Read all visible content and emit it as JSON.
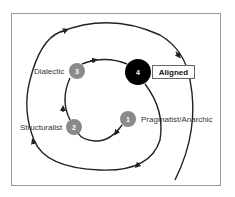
{
  "diagram": {
    "type": "spiral-cycle",
    "stages": [
      {
        "number": "1",
        "label": "Pragmatist/Anarchic",
        "style": "gray"
      },
      {
        "number": "2",
        "label": "Structuralist",
        "style": "gray"
      },
      {
        "number": "3",
        "label": "Dialectic",
        "style": "gray"
      },
      {
        "number": "4",
        "label": "Aligned",
        "style": "black-highlighted"
      }
    ],
    "colors": {
      "stage_gray": "#8a8a8a",
      "stage_highlight": "#000000",
      "line": "#222222",
      "frame": "#9a9a9a"
    }
  }
}
